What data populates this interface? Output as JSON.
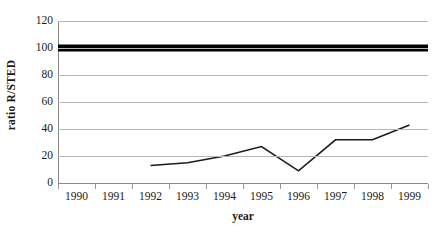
{
  "chart_data": {
    "type": "line",
    "title": "",
    "xlabel": "year",
    "ylabel": "ratio R/STED",
    "categories": [
      "1990",
      "1991",
      "1992",
      "1993",
      "1994",
      "1995",
      "1996",
      "1997",
      "1998",
      "1999"
    ],
    "ylim": [
      0,
      120
    ],
    "yticks": [
      0,
      20,
      40,
      60,
      80,
      100,
      120
    ],
    "ytick_labels": [
      "0",
      "20",
      "40",
      "60",
      "80",
      "100",
      "120"
    ],
    "grid": "horizontal",
    "legend": "none",
    "series": [
      {
        "name": "ratio R/STED",
        "style": "thin-line",
        "color": "#1a1a1a",
        "x": [
          "1992",
          "1993",
          "1994",
          "1995",
          "1996",
          "1997",
          "1998",
          "1999"
        ],
        "values": [
          13,
          15,
          20,
          27,
          9,
          32,
          32,
          43
        ]
      },
      {
        "name": "reference level 100",
        "style": "thick-line",
        "color": "#000000",
        "x": [
          "1990",
          "1999"
        ],
        "values": [
          100,
          100
        ]
      }
    ]
  },
  "axes": {
    "y_title": "ratio R/STED",
    "x_title": "year"
  }
}
